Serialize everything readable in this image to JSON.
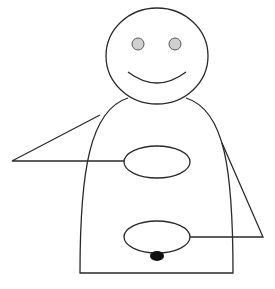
{
  "figure": {
    "colors": {
      "stroke": "#2a2a2a",
      "eye_fill": "#d0d0d0",
      "dot_fill": "#111111",
      "background": "#ffffff"
    },
    "head": {
      "cx": 157,
      "cy": 56,
      "rx": 51,
      "ry": 48
    },
    "eyes": [
      {
        "cx": 138,
        "cy": 44,
        "rx": 6,
        "ry": 6
      },
      {
        "cx": 175,
        "cy": 44,
        "rx": 6,
        "ry": 6
      }
    ],
    "mouth": {
      "path": "M 128 72 Q 157 94 186 72"
    },
    "body": {
      "path": "M 128 98 C 90 110, 80 170, 80 273 L 233 273 C 233 170, 225 110, 186 98"
    },
    "upper_ellipse": {
      "cx": 157,
      "cy": 162,
      "rx": 33,
      "ry": 16
    },
    "lower_ellipse": {
      "cx": 157,
      "cy": 237,
      "rx": 33,
      "ry": 16
    },
    "dot": {
      "cx": 157,
      "cy": 256,
      "rx": 7,
      "ry": 5
    },
    "left_connector": {
      "points": "100,115 12,161 124,161"
    },
    "right_connector": {
      "points": "222,143 263,237 190,237"
    }
  }
}
